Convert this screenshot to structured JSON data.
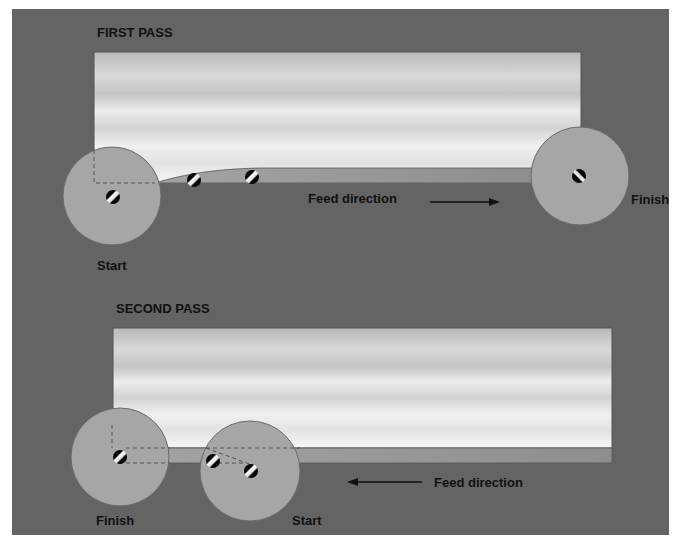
{
  "figure": {
    "panel_color": "#646464",
    "workpiece_light": "#f2f2f2",
    "workpiece_dark": "#b8b8b8",
    "strip_color": "#9a9a9a",
    "wheel_color": "#a6a6a6",
    "text_color": "#111111"
  },
  "first_pass": {
    "title": "FIRST PASS",
    "feed_label": "Feed direction",
    "feed_arrow": "right",
    "start_label": "Start",
    "finish_label": "Finish"
  },
  "second_pass": {
    "title": "SECOND PASS",
    "feed_label": "Feed direction",
    "feed_arrow": "left",
    "start_label": "Start",
    "finish_label": "Finish"
  }
}
